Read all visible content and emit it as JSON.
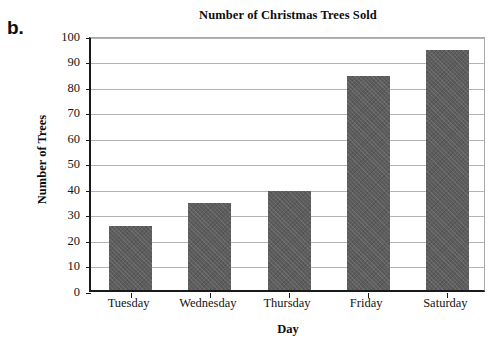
{
  "part_label": "b.",
  "chart_data": {
    "type": "bar",
    "title": "Number of Christmas Trees Sold",
    "xlabel": "Day",
    "ylabel": "Number of Trees",
    "categories": [
      "Tuesday",
      "Wednesday",
      "Thursday",
      "Friday",
      "Saturday"
    ],
    "values": [
      25,
      34,
      39,
      84,
      94
    ],
    "ylim": [
      0,
      100
    ],
    "ytick_values": [
      0,
      10,
      20,
      30,
      40,
      50,
      60,
      70,
      80,
      90,
      100
    ],
    "ytick_labels": [
      "0",
      "10",
      "20",
      "30",
      "40",
      "50",
      "60",
      "70",
      "80",
      "90",
      "100"
    ],
    "grid": "horizontal",
    "legend": "none",
    "bar_color": "#5d5d5d",
    "gridline_color": "#b4b4b4",
    "axis_color": "#1a1a1a"
  }
}
